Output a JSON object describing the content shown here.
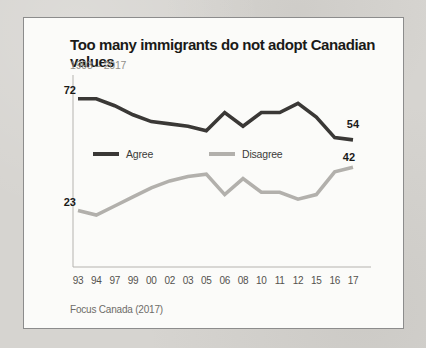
{
  "chart_data": {
    "type": "line",
    "title": "Too many immigrants do not adopt Canadian values",
    "subtitle": "1993 – 2017",
    "source": "Focus Canada (2017)",
    "categories": [
      "93",
      "94",
      "97",
      "99",
      "00",
      "02",
      "03",
      "05",
      "06",
      "08",
      "10",
      "11",
      "12",
      "15",
      "16",
      "17"
    ],
    "series": [
      {
        "name": "Agree",
        "color": "#3a3836",
        "values": [
          72,
          72,
          69,
          65,
          62,
          61,
          60,
          58,
          66,
          60,
          66,
          66,
          70,
          64,
          55,
          54
        ],
        "first_label": "72",
        "last_label": "54"
      },
      {
        "name": "Disagree",
        "color": "#b2b0ac",
        "values": [
          23,
          21,
          25,
          29,
          33,
          36,
          38,
          39,
          30,
          37,
          31,
          31,
          28,
          30,
          40,
          42
        ],
        "first_label": "23",
        "last_label": "42"
      }
    ],
    "ylim": [
      0,
      80
    ],
    "grid": false,
    "axis_color": "#b5b3af",
    "legend_position": "inside-center-left"
  }
}
